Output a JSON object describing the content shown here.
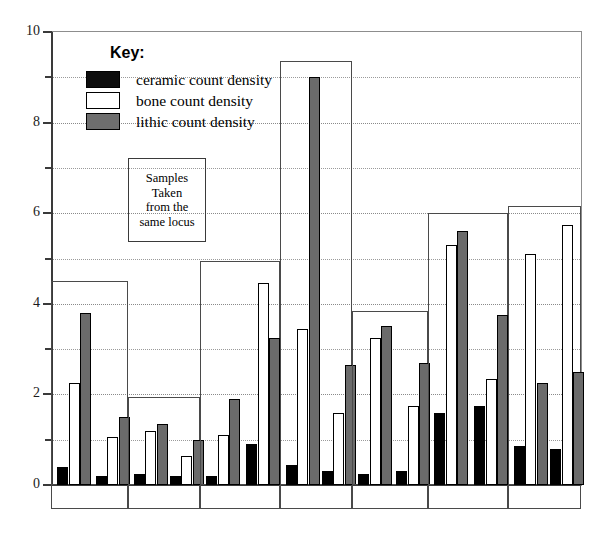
{
  "chart_data": {
    "type": "bar",
    "title": "",
    "xlabel": "",
    "ylabel": "",
    "ylim": [
      0,
      10
    ],
    "grid": true,
    "y_ticks_major": [
      0,
      2,
      4,
      6,
      8,
      10
    ],
    "y_ticks_minor": [
      1,
      3,
      5,
      7,
      9
    ],
    "y_tick_labels": [
      "0",
      "2",
      "4",
      "6",
      "8",
      "10"
    ],
    "legend": {
      "title": "Key:",
      "position": "inside-top-left",
      "entries": [
        {
          "name": "ceramic count density",
          "key": "ceramic",
          "color": "#0d0d0d"
        },
        {
          "name": "bone count density",
          "key": "bone",
          "color": "#ffffff"
        },
        {
          "name": "lithic count density",
          "key": "lithic",
          "color": "#6e6e6e"
        }
      ]
    },
    "annotation": {
      "lines": [
        "Samples",
        "Taken",
        "from the",
        "same locus"
      ]
    },
    "series": [
      {
        "name": "ceramic count density",
        "key": "ceramic"
      },
      {
        "name": "bone count density",
        "key": "bone"
      },
      {
        "name": "lithic count density",
        "key": "lithic"
      }
    ],
    "groups": [
      {
        "label": "",
        "box_top_value": 4.5,
        "samples": [
          {
            "ceramic": 0.4,
            "bone": 2.25,
            "lithic": 3.8
          },
          {
            "ceramic": 0.2,
            "bone": 1.05,
            "lithic": 1.5
          }
        ]
      },
      {
        "label": "",
        "box_top_value": 1.95,
        "samples": [
          {
            "ceramic": 0.25,
            "bone": 1.2,
            "lithic": 1.35
          },
          {
            "ceramic": 0.2,
            "bone": 0.65,
            "lithic": 1.0
          }
        ]
      },
      {
        "label": "",
        "box_top_value": 4.95,
        "samples": [
          {
            "ceramic": 0.2,
            "bone": 1.1,
            "lithic": 1.9
          },
          {
            "ceramic": 0.9,
            "bone": 4.45,
            "lithic": 3.25
          }
        ]
      },
      {
        "label": "",
        "box_top_value": 9.35,
        "samples": [
          {
            "ceramic": 0.45,
            "bone": 3.45,
            "lithic": 9.0
          },
          {
            "ceramic": 0.3,
            "bone": 1.6,
            "lithic": 2.65
          }
        ]
      },
      {
        "label": "",
        "box_top_value": 3.85,
        "samples": [
          {
            "ceramic": 0.25,
            "bone": 3.25,
            "lithic": 3.5
          },
          {
            "ceramic": 0.3,
            "bone": 1.75,
            "lithic": 2.7
          }
        ]
      },
      {
        "label": "",
        "box_top_value": 6.0,
        "samples": [
          {
            "ceramic": 1.6,
            "bone": 5.3,
            "lithic": 5.6
          },
          {
            "ceramic": 1.75,
            "bone": 2.35,
            "lithic": 3.75
          }
        ]
      },
      {
        "label": "",
        "box_top_value": 6.15,
        "samples": [
          {
            "ceramic": 0.85,
            "bone": 5.1,
            "lithic": 2.25
          },
          {
            "ceramic": 0.8,
            "bone": 5.75,
            "lithic": 2.5
          }
        ]
      }
    ]
  }
}
